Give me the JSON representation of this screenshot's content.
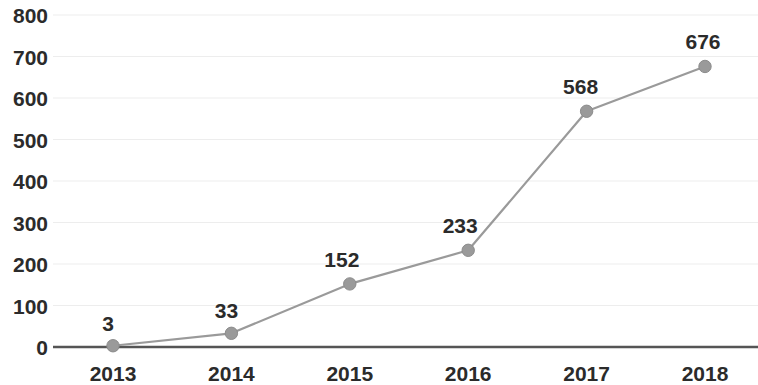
{
  "chart_data": {
    "type": "line",
    "title": "",
    "subtitle": "",
    "xlabel": "",
    "ylabel": "",
    "categories": [
      "2013",
      "2014",
      "2015",
      "2016",
      "2017",
      "2018"
    ],
    "values": [
      3,
      33,
      152,
      233,
      568,
      676
    ],
    "point_labels": [
      "3",
      "33",
      "152",
      "233",
      "568",
      "676"
    ],
    "series": [
      {
        "name": "",
        "values": [
          3,
          33,
          152,
          233,
          568,
          676
        ]
      }
    ],
    "ylim": [
      0,
      800
    ],
    "ytick_labels": [
      "800",
      "700",
      "600",
      "500",
      "400",
      "300",
      "200",
      "100",
      "0"
    ],
    "ytick_values": [
      800,
      700,
      600,
      500,
      400,
      300,
      200,
      100,
      0
    ],
    "xtick_labels": [
      "2013",
      "2014",
      "2015",
      "2016",
      "2017",
      "2018"
    ],
    "grid": true,
    "grid_axis": "y",
    "legend": false,
    "legend_position": "none",
    "show_data_labels": true,
    "markers": true,
    "annotations": []
  },
  "style": {
    "line_color": "#9a9a9a",
    "marker_color": "#9a9a9a",
    "marker_edge_color": "#8c8c8c",
    "axis_color": "#555555",
    "grid_color": "#ededed",
    "text_color": "#2b2b2b",
    "background": "#ffffff"
  }
}
